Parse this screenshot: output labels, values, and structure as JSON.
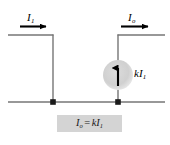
{
  "figure": {
    "background_color": "#ffffff",
    "wire_color": "#6b6b6b",
    "arrow_color": "#000000",
    "node_color": "#1a1a1a",
    "source_fill_color": "#d0d0d0",
    "equation_box_color": "#d4d4d4"
  },
  "labels": {
    "input_current": {
      "symbol": "I",
      "subscript": "1"
    },
    "output_current": {
      "symbol": "I",
      "subscript": "o"
    },
    "source_value": {
      "gain": "k",
      "symbol": "I",
      "subscript": "1"
    }
  },
  "equation": {
    "lhs_symbol": "I",
    "lhs_subscript": "o",
    "operator": "=",
    "rhs_gain": "k",
    "rhs_symbol": "I",
    "rhs_subscript": "1"
  },
  "arrows": {
    "input_direction": "right",
    "output_direction": "right",
    "source_direction": "up"
  },
  "nodes": {
    "left_node": "junction",
    "right_node": "junction"
  }
}
